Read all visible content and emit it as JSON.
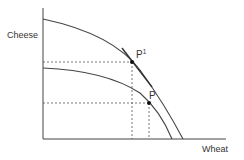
{
  "diagram": {
    "type": "production-possibility-frontier",
    "axes": {
      "y_label": "Cheese",
      "x_label": "Wheat"
    },
    "curves": [
      {
        "name": "outer-ppf",
        "description": "Outer production possibility frontier"
      },
      {
        "name": "inner-ppf",
        "description": "Inner production possibility frontier"
      }
    ],
    "points": {
      "p1": {
        "label": "P",
        "superscript": "1"
      },
      "p": {
        "label": "P"
      }
    },
    "colors": {
      "line": "#333333",
      "dash": "#555555",
      "text": "#333333"
    }
  }
}
